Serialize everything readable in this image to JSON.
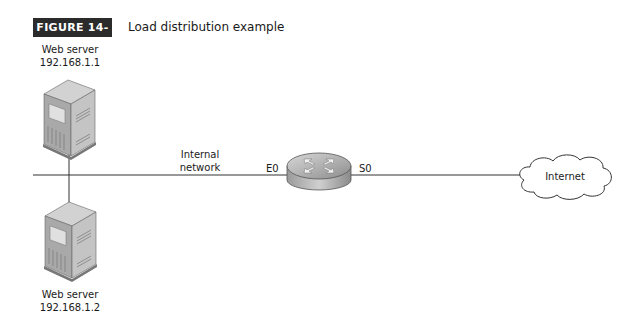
{
  "figure": {
    "number": "FIGURE 14-4",
    "title": "Load distribution example"
  },
  "nodes": {
    "server1": {
      "name": "Web server",
      "ip": "192.168.1.1"
    },
    "server2": {
      "name": "Web server",
      "ip": "192.168.1.2"
    },
    "router": {
      "interface_left": "E0",
      "interface_right": "S0"
    },
    "cloud": {
      "label": "Internet"
    }
  },
  "links": {
    "internal_network_label_line1": "Internal",
    "internal_network_label_line2": "network"
  },
  "colors": {
    "badge_bg": "#2b2b2b",
    "line": "#333333",
    "device_gray": "#b8b8b8"
  }
}
